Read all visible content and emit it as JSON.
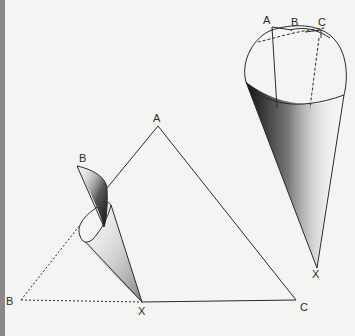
{
  "figure": {
    "left_triangle": {
      "vertices": {
        "A": "A",
        "C": "C",
        "X": "X",
        "B_top": "B",
        "B_left": "B"
      },
      "description": "Triangle ABC with corner B rolled into a cone toward apex X"
    },
    "right_cone": {
      "rim_labels": {
        "A": "A",
        "B": "B",
        "C": "C"
      },
      "apex_label": "X",
      "description": "Cone with rim points A, B, C and apex X"
    }
  },
  "colors": {
    "line": "#2a2a2a",
    "background": "#f4f4f2",
    "edge_bar": "#8a8a8a"
  }
}
